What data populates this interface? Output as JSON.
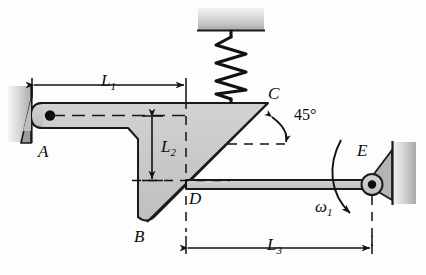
{
  "figure": {
    "type": "mechanism-kinematic-diagram",
    "background_color": "#fdfdfd",
    "body_fill": "#c9c9c9",
    "outline_color": "#1a1a1a",
    "wall_fill_light": "#e8e8e8",
    "wall_fill_dark": "#b6b6b6"
  },
  "labels": {
    "point_a": "A",
    "point_b": "B",
    "point_c": "C",
    "point_d": "D",
    "point_e": "E",
    "dim_l1": "L",
    "dim_l1_sub": "1",
    "dim_l2": "L",
    "dim_l2_sub": "2",
    "dim_l3": "L",
    "dim_l3_sub": "3",
    "angle": "45°",
    "omega": "ω",
    "omega_sub": "1"
  },
  "dimensions": {
    "l1": {
      "label": "L1",
      "from": "A",
      "to": "vertical through D",
      "orientation": "horizontal"
    },
    "l2": {
      "label": "L2",
      "from": "link AB centerline",
      "to": "D level",
      "orientation": "vertical"
    },
    "l3": {
      "label": "L3",
      "from": "D",
      "to": "E",
      "orientation": "horizontal"
    }
  },
  "angles": {
    "at_c": {
      "value": "45°",
      "between": "vertical at C",
      "and": "line CB"
    }
  },
  "joints": [
    {
      "name": "A",
      "type": "ground-pivot",
      "wall": "left"
    },
    {
      "name": "B",
      "type": "link-end"
    },
    {
      "name": "C",
      "type": "spring-attachment"
    },
    {
      "name": "D",
      "type": "pin-joint"
    },
    {
      "name": "E",
      "type": "ground-pivot",
      "wall": "right"
    }
  ],
  "components": {
    "spring": {
      "name": "coil-spring",
      "anchor": "top-wall",
      "attaches_to": "C",
      "coils": 7
    },
    "rod_de": {
      "name": "connecting-rod",
      "from": "D",
      "to": "E"
    },
    "link_ab": {
      "name": "bell-crank-link",
      "from": "A",
      "to": "B"
    },
    "web_cbd": {
      "name": "triangular-web",
      "vertices": "C, B, D"
    }
  },
  "motion": {
    "omega_label": "ω",
    "omega_subscript": "1",
    "sense": "clockwise",
    "at_joint": "E"
  }
}
